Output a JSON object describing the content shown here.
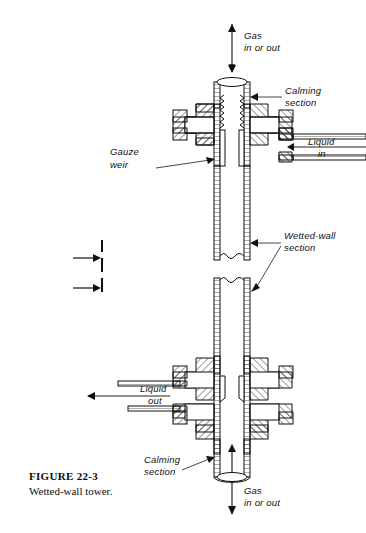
{
  "figure": {
    "number_label": "FIGURE  22-3",
    "caption": "Wetted-wall tower.",
    "title": "Wetted-wall tower"
  },
  "colors": {
    "ink": "#111111",
    "background": "#ffffff",
    "hatch": "#222222",
    "leader": "#333333"
  },
  "annotations": {
    "gas_top_line1": "Gas",
    "gas_top_line2": "in or out",
    "calming_top_line1": "Calming",
    "calming_top_line2": "section",
    "gauze_line1": "Gauze",
    "gauze_line2": "weir",
    "liquid_in_line1": "Liquid",
    "liquid_in_line2": "in",
    "wetted_line1": "Wetted-wall",
    "wetted_line2": "section",
    "liquid_out_line1": "Liquid",
    "liquid_out_line2": "out",
    "calming_bottom_line1": "Calming",
    "calming_bottom_line2": "section",
    "gas_bottom_line1": "Gas",
    "gas_bottom_line2": "in or out"
  },
  "diagram": {
    "type": "engineering-cross-section",
    "break_symbol": "centerline-break-with-two-arrows"
  }
}
